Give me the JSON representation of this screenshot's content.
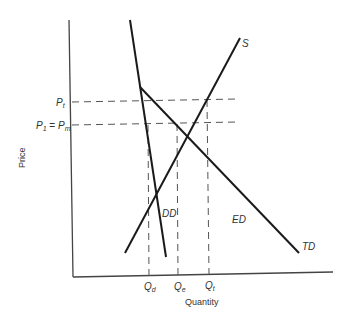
{
  "diagram": {
    "axes": {
      "xlabel": "Quantity",
      "ylabel": "Price"
    },
    "price_labels": {
      "pt": {
        "main": "P",
        "sub": "t"
      },
      "p1_pm": {
        "left_main": "P",
        "left_sub": "1",
        "eq": " = ",
        "right_main": "P",
        "right_sub": "m"
      }
    },
    "quantity_labels": {
      "qd": {
        "main": "Q",
        "sub": "d"
      },
      "qe": {
        "main": "Q",
        "sub": "e"
      },
      "qt": {
        "main": "Q",
        "sub": "t"
      }
    },
    "curve_labels": {
      "supply": "S",
      "domestic_demand": "DD",
      "export_demand": "ED",
      "total_demand": "TD"
    },
    "colors": {
      "line": "#1a1a1a",
      "axis": "#444444",
      "dash": "#555555",
      "text": "#333333"
    }
  }
}
